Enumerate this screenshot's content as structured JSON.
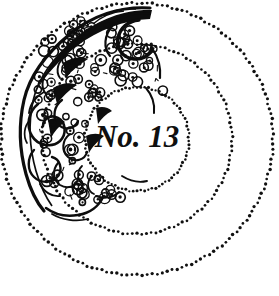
{
  "plate": {
    "name": "engraved-ornament-plate",
    "background_color": "#ffffff",
    "ink_color": "#111111",
    "center_label": "No. 13",
    "label_style": "handwritten-italic-script",
    "medium": "engraving / etching, black ink on white"
  },
  "rings": {
    "center_x": 137,
    "center_y": 139,
    "items": [
      {
        "name": "inner-dotted-circle",
        "radius": 52,
        "dot_radius": 1.35,
        "dot_count": 86,
        "color": "#111111"
      },
      {
        "name": "middle-dotted-circle",
        "radius": 95,
        "dot_radius": 1.45,
        "dot_count": 126,
        "color": "#111111"
      },
      {
        "name": "outer-dotted-circle",
        "radius": 136,
        "dot_radius": 1.55,
        "dot_count": 168,
        "color": "#111111"
      }
    ]
  },
  "ornament": {
    "name": "rococo-cartouche-ornament",
    "description": "baroque scroll cartouche with clustered berry and foliage texture",
    "position": "upper-left",
    "color": "#0d0d0d",
    "cluster_count": 118,
    "scroll_count": 9
  },
  "colors": {
    "ink": "#111111",
    "ink_deep": "#0d0d0d",
    "paper": "#ffffff"
  }
}
